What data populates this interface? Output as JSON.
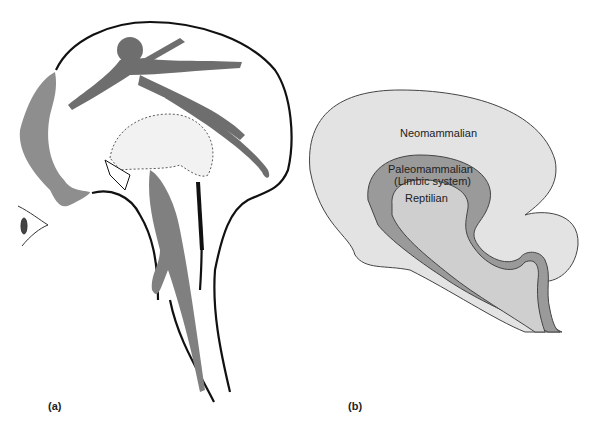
{
  "figure": {
    "panel_a": {
      "label": "(a)",
      "animals": [
        "dolphin",
        "monkey",
        "hedgehog",
        "lizard"
      ],
      "eye": "eye-icon"
    },
    "panel_b": {
      "label": "(b)",
      "regions": [
        {
          "name": "Neomammalian",
          "color": "#e3e3e3"
        },
        {
          "name": "Paleomammalian",
          "sub": "(Limbic system)",
          "color": "#9a9a9a"
        },
        {
          "name": "Reptilian",
          "color": "#cfcfcf"
        }
      ]
    }
  }
}
